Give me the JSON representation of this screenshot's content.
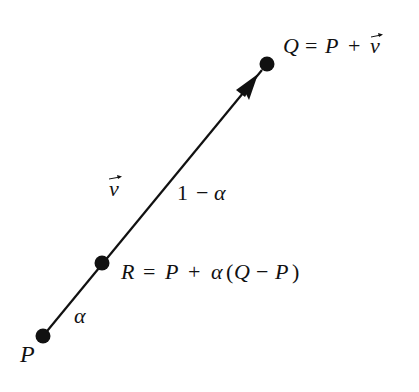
{
  "diagram": {
    "type": "vector-parametric-point",
    "colors": {
      "ink": "#111111",
      "background": "#ffffff"
    },
    "points": [
      {
        "id": "P",
        "label": "P",
        "x": 43,
        "y": 336
      },
      {
        "id": "R",
        "label": "R = P + α(Q − P)",
        "x": 102,
        "y": 263
      },
      {
        "id": "Q",
        "label": "Q = P + v⃗",
        "x": 267,
        "y": 64
      }
    ],
    "segment_labels": {
      "alpha": "α",
      "one_minus_alpha": "1 − α",
      "vector": "v"
    },
    "labels": {
      "P": "P",
      "Q_lhs": "Q",
      "Q_eq": "=",
      "Q_P": "P",
      "Q_plus": "+",
      "Q_v": "v",
      "R_lhs": "R",
      "R_eq": "=",
      "R_P": "P",
      "R_plus": "+",
      "R_alpha": "α",
      "R_open": "(",
      "R_Q": "Q",
      "R_minus": "−",
      "R_P2": "P",
      "R_close": ")",
      "alpha": "α",
      "one": "1",
      "minus": "−",
      "alpha2": "α",
      "v": "v"
    }
  }
}
